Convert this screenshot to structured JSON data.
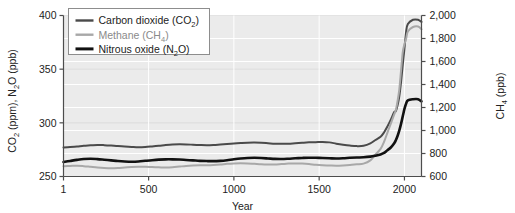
{
  "chart_data": {
    "type": "line",
    "title": "",
    "xlabel": "Year",
    "ylabel_left": "CO2 (ppm), N2O (ppb)",
    "ylabel_right": "CH4 (ppb)",
    "xlim": [
      1,
      2100
    ],
    "ylim_left": [
      250,
      400
    ],
    "ylim_right": [
      600,
      2000
    ],
    "xticks": [
      1,
      500,
      1000,
      1500,
      2000
    ],
    "xticklabels": [
      "1",
      "500",
      "1000",
      "1500",
      "2000"
    ],
    "yticks_left": [
      250,
      300,
      350,
      400
    ],
    "yticklabels_left": [
      "250",
      "300",
      "350",
      "400"
    ],
    "yticks_right": [
      600,
      800,
      1000,
      1200,
      1400,
      1600,
      1800,
      2000
    ],
    "yticklabels_right": [
      "600",
      "800",
      "1,000",
      "1,200",
      "1,400",
      "1,600",
      "1,800",
      "2,000"
    ],
    "grid": true,
    "grid_color": "#ffffff",
    "plot_background": "#ebebeb",
    "legend_position": "top-left",
    "legend": [
      {
        "label_main": "Carbon dioxide (CO",
        "sub": "2",
        "tail": ")",
        "color": "#4a4a4a",
        "width": 2.0,
        "name": "carbon-dioxide"
      },
      {
        "label_main": "Methane (CH",
        "sub": "4",
        "tail": ")",
        "color": "#a8a8a8",
        "width": 2.0,
        "name": "methane"
      },
      {
        "label_main": "Nitrous oxide (N",
        "sub": "2",
        "tail": "O)",
        "color": "#111111",
        "width": 2.6,
        "name": "nitrous-oxide"
      }
    ],
    "series": [
      {
        "name": "Carbon dioxide (CO2)",
        "axis": "left",
        "unit": "ppm",
        "color": "#4a4a4a",
        "width": 2.0,
        "x": [
          1,
          40,
          80,
          120,
          160,
          200,
          240,
          280,
          320,
          360,
          400,
          440,
          480,
          520,
          560,
          600,
          640,
          680,
          720,
          760,
          800,
          840,
          880,
          920,
          960,
          1000,
          1040,
          1080,
          1120,
          1160,
          1200,
          1240,
          1280,
          1320,
          1360,
          1400,
          1440,
          1480,
          1520,
          1560,
          1600,
          1640,
          1680,
          1720,
          1760,
          1800,
          1830,
          1860,
          1880,
          1900,
          1920,
          1940,
          1950,
          1960,
          1970,
          1980,
          1990,
          2000,
          2010,
          2020,
          2050,
          2080,
          2100
        ],
        "y": [
          277,
          277.5,
          278,
          278.6,
          279,
          279.4,
          279.2,
          278.8,
          278.3,
          278,
          277.6,
          277.3,
          277.5,
          278,
          278.6,
          279.3,
          279.8,
          280,
          279.9,
          279.6,
          279.3,
          279.1,
          279.3,
          279.8,
          280.3,
          280.8,
          281.2,
          281.5,
          281.6,
          281.4,
          281,
          280.6,
          280.4,
          280.6,
          281,
          281.4,
          281.8,
          282,
          282.2,
          281.8,
          280.6,
          279.6,
          278.8,
          278.3,
          278.6,
          280.8,
          284,
          287,
          291,
          296.5,
          303,
          310,
          311,
          316.5,
          325,
          338,
          354,
          369,
          385,
          392,
          396,
          396,
          394
        ]
      },
      {
        "name": "Methane (CH4)",
        "axis": "right",
        "unit": "ppb",
        "color": "#a8a8a8",
        "width": 2.0,
        "x": [
          1,
          40,
          80,
          120,
          160,
          200,
          240,
          280,
          320,
          360,
          400,
          440,
          480,
          520,
          560,
          600,
          640,
          680,
          720,
          760,
          800,
          840,
          880,
          920,
          960,
          1000,
          1040,
          1080,
          1120,
          1160,
          1200,
          1240,
          1280,
          1320,
          1360,
          1400,
          1440,
          1480,
          1520,
          1560,
          1600,
          1640,
          1680,
          1720,
          1760,
          1800,
          1830,
          1860,
          1880,
          1900,
          1920,
          1940,
          1950,
          1960,
          1970,
          1980,
          1990,
          2000,
          2010,
          2020,
          2050,
          2080,
          2100
        ],
        "y": [
          690,
          692,
          694,
          690,
          684,
          678,
          674,
          672,
          674,
          678,
          682,
          684,
          684,
          682,
          680,
          678,
          680,
          686,
          692,
          696,
          698,
          698,
          700,
          704,
          710,
          714,
          716,
          714,
          710,
          706,
          704,
          704,
          708,
          712,
          714,
          712,
          708,
          702,
          698,
          696,
          694,
          696,
          700,
          706,
          712,
          740,
          790,
          840,
          900,
          980,
          1060,
          1140,
          1180,
          1260,
          1360,
          1520,
          1680,
          1750,
          1800,
          1860,
          1900,
          1905,
          1880
        ]
      },
      {
        "name": "Nitrous oxide (N2O)",
        "axis": "left",
        "unit": "ppb",
        "color": "#111111",
        "width": 2.6,
        "x": [
          1,
          40,
          80,
          120,
          160,
          200,
          240,
          280,
          320,
          360,
          400,
          440,
          480,
          520,
          560,
          600,
          640,
          680,
          720,
          760,
          800,
          840,
          880,
          920,
          960,
          1000,
          1040,
          1080,
          1120,
          1160,
          1200,
          1240,
          1280,
          1320,
          1360,
          1400,
          1440,
          1480,
          1520,
          1560,
          1600,
          1640,
          1680,
          1720,
          1760,
          1800,
          1830,
          1860,
          1880,
          1900,
          1920,
          1940,
          1950,
          1960,
          1970,
          1980,
          1990,
          2000,
          2010,
          2020,
          2050,
          2080,
          2100
        ],
        "y": [
          263.5,
          264.5,
          265.5,
          266.3,
          266.6,
          266.2,
          265.6,
          265,
          264.4,
          264,
          263.8,
          264,
          264.6,
          265.2,
          265.7,
          266,
          266,
          265.8,
          265.4,
          265,
          264.6,
          264.4,
          264.3,
          264.6,
          265.2,
          266,
          266.7,
          267.2,
          267.4,
          267.2,
          266.8,
          266.4,
          266.3,
          266.6,
          267,
          267.3,
          267.5,
          267.4,
          267.2,
          267,
          266.8,
          267,
          267.4,
          267.7,
          267.9,
          268.5,
          269.4,
          270.6,
          272,
          274.5,
          277,
          281,
          284,
          288,
          293,
          299,
          306,
          313,
          318,
          321,
          322,
          322,
          320
        ]
      }
    ]
  }
}
